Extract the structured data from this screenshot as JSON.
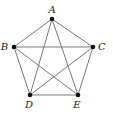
{
  "diagram": {
    "type": "complete-graph",
    "name": "K5",
    "vertices": [
      {
        "id": "A",
        "label": "A",
        "x": 52,
        "y": 19,
        "lx": 52,
        "ly": 13,
        "anchor": "middle"
      },
      {
        "id": "B",
        "label": "B",
        "x": 14,
        "y": 47,
        "lx": 8,
        "ly": 50,
        "anchor": "end"
      },
      {
        "id": "C",
        "label": "C",
        "x": 93,
        "y": 47,
        "lx": 98,
        "ly": 50,
        "anchor": "start"
      },
      {
        "id": "D",
        "label": "D",
        "x": 30,
        "y": 95,
        "lx": 29,
        "ly": 108,
        "anchor": "middle"
      },
      {
        "id": "E",
        "label": "E",
        "x": 78,
        "y": 95,
        "lx": 77,
        "ly": 108,
        "anchor": "middle"
      }
    ],
    "edges": [
      [
        "A",
        "B"
      ],
      [
        "A",
        "C"
      ],
      [
        "A",
        "D"
      ],
      [
        "A",
        "E"
      ],
      [
        "B",
        "C"
      ],
      [
        "B",
        "D"
      ],
      [
        "B",
        "E"
      ],
      [
        "C",
        "D"
      ],
      [
        "C",
        "E"
      ],
      [
        "D",
        "E"
      ]
    ],
    "colors": {
      "edge": "#7a7a7a",
      "vertex": "#111111",
      "label": "#222222"
    }
  }
}
